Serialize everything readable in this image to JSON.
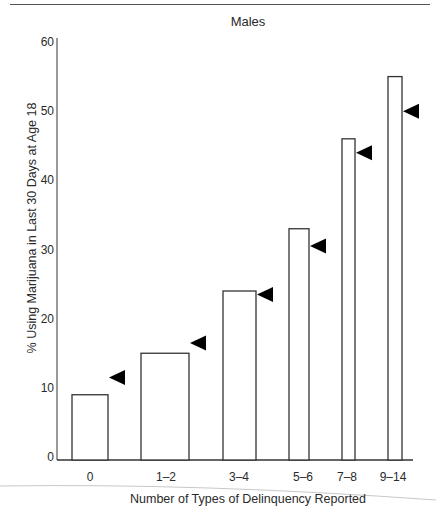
{
  "page": {
    "header_rule": true
  },
  "chart_data": {
    "type": "bar",
    "title": "Males",
    "xlabel": "Number of Types of Delinquency Reported",
    "ylabel": "% Using Marijuana in Last 30 Days at Age 18",
    "ylim": [
      0,
      60
    ],
    "yticks": [
      0,
      10,
      20,
      30,
      40,
      50,
      60
    ],
    "grid": false,
    "legend": null,
    "categories": [
      "0",
      "1–2",
      "3–4",
      "5–6",
      "7–8",
      "9–14"
    ],
    "series": [
      {
        "name": "Observed % (bars)",
        "style": "open-bar",
        "values": [
          9,
          15,
          24,
          33,
          46,
          55
        ]
      },
      {
        "name": "Comparison marker (triangles)",
        "style": "left-pointing-filled-triangle",
        "values": [
          11.5,
          16.5,
          23.5,
          30.5,
          44,
          50
        ]
      }
    ],
    "bar_widths_note": "bar widths vary by category (proportional to group size)",
    "layout": {
      "bars_px": [
        {
          "x0": 72,
          "x1": 108,
          "label_x": 90
        },
        {
          "x0": 141,
          "x1": 189,
          "label_x": 166
        },
        {
          "x0": 223,
          "x1": 256,
          "label_x": 239
        },
        {
          "x0": 289,
          "x1": 309,
          "label_x": 303
        },
        {
          "x0": 342,
          "x1": 355,
          "label_x": 347
        },
        {
          "x0": 388,
          "x1": 402,
          "label_x": 393
        }
      ]
    }
  }
}
